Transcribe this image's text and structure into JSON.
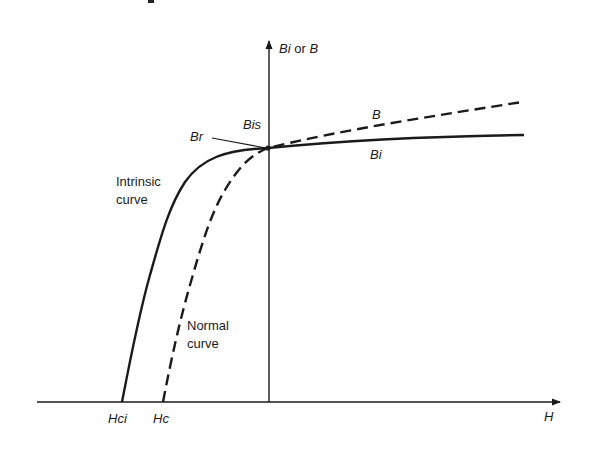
{
  "diagram": {
    "colors": {
      "ink": "#1a1a1a",
      "background": "#ffffff"
    },
    "axes": {
      "y_label_italic_1": "Bi",
      "y_label_or": "or",
      "y_label_italic_2": "B",
      "x_label": "H"
    },
    "labels": {
      "br": "Br",
      "bis": "Bis",
      "b": "B",
      "bi": "Bi",
      "intrinsic_line1": "Intrinsic",
      "intrinsic_line2": "curve",
      "normal_line1": "Normal",
      "normal_line2": "curve",
      "hci": "Hci",
      "hc": "Hc"
    },
    "curves": [
      {
        "name": "Intrinsic curve",
        "style": "solid",
        "label": "Bi",
        "x_intercept_label": "Hci"
      },
      {
        "name": "Normal curve",
        "style": "dashed",
        "label": "B",
        "x_intercept_label": "Hc"
      }
    ]
  }
}
